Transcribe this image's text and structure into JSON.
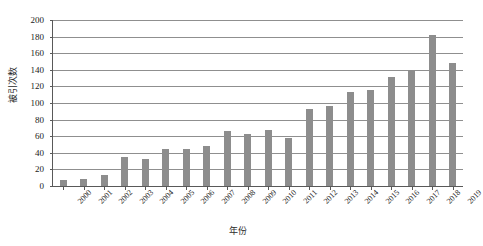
{
  "chart_data": {
    "type": "bar",
    "title": "",
    "subtitle": "",
    "xlabel": "年份",
    "ylabel": "被引次数",
    "categories": [
      "2000",
      "2001",
      "2002",
      "2003",
      "2004",
      "2005",
      "2006",
      "2007",
      "2008",
      "2009",
      "2010",
      "2011",
      "2012",
      "2013",
      "2014",
      "2015",
      "2016",
      "2017",
      "2018",
      "2019"
    ],
    "values": [
      7,
      8,
      13,
      35,
      32,
      44,
      45,
      48,
      66,
      63,
      68,
      58,
      93,
      96,
      113,
      116,
      131,
      140,
      182,
      148
    ],
    "series": [
      {
        "name": "被引次数",
        "values": [
          7,
          8,
          13,
          35,
          32,
          44,
          45,
          48,
          66,
          63,
          68,
          58,
          93,
          96,
          113,
          116,
          131,
          140,
          182,
          148
        ]
      }
    ],
    "ylim": [
      0,
      200
    ],
    "ytick_labels": [
      "0",
      "20",
      "40",
      "60",
      "80",
      "100",
      "120",
      "140",
      "160",
      "180",
      "200"
    ],
    "ytick_values": [
      0,
      20,
      40,
      60,
      80,
      100,
      120,
      140,
      160,
      180,
      200
    ],
    "ytick_step": 20,
    "grid": true,
    "grid_axis": "y",
    "legend": false,
    "legend_position": "none",
    "bar_color": "#8d8d8d",
    "gridline_color": "#8f8f8f",
    "axis_color": "#595959",
    "background_color": "#ffffff",
    "annotations": []
  }
}
